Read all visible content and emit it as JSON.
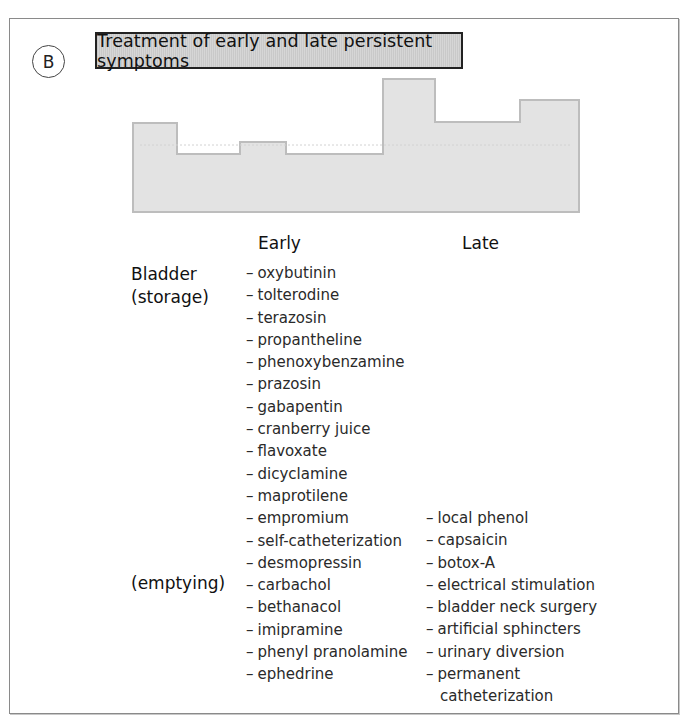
{
  "panel": {
    "badge": "B",
    "title": "Treatment of early and late persistent symptoms"
  },
  "columns": {
    "early": "Early",
    "late": "Late"
  },
  "row_labels": {
    "bladder": "Bladder",
    "storage": "(storage)",
    "emptying": "(emptying)"
  },
  "step_profile": {
    "fill": "#e3e3e3",
    "stroke": "#bdbdbd",
    "points": "133,123 177,123 177,154 240,154 240,142 286,142 286,154 383,154 383,79 435,79 435,122 520,122 520,100 579,100 579,212 133,212"
  },
  "early_treatments": [
    "oxybutinin",
    "tolterodine",
    "terazosin",
    "propantheline",
    "phenoxybenzamine",
    "prazosin",
    "gabapentin",
    "cranberry juice",
    "flavoxate",
    "dicyclamine",
    "maprotilene",
    "empromium",
    "self-catheterization",
    "desmopressin",
    "carbachol",
    "bethanacol",
    "imipramine",
    "phenyl pranolamine",
    "ephedrine"
  ],
  "late_treatments": [
    "local phenol",
    "capsaicin",
    "botox-A",
    "electrical stimulation",
    "bladder neck surgery",
    "artificial sphincters",
    "urinary diversion",
    "permanent"
  ],
  "late_treatments_continuation": "catheterization",
  "dash": "–"
}
